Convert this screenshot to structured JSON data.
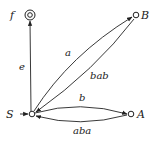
{
  "diagram": {
    "type": "finite-automaton",
    "nodes": [
      {
        "id": "S",
        "label": "S",
        "start": true,
        "accepting": false
      },
      {
        "id": "f",
        "label": "f",
        "start": false,
        "accepting": true
      },
      {
        "id": "B",
        "label": "B",
        "start": false,
        "accepting": false
      },
      {
        "id": "A",
        "label": "A",
        "start": false,
        "accepting": false
      }
    ],
    "edges": [
      {
        "from": "S",
        "to": "f",
        "label": "e"
      },
      {
        "from": "S",
        "to": "B",
        "label": "a"
      },
      {
        "from": "B",
        "to": "S",
        "label": "bab"
      },
      {
        "from": "S",
        "to": "A",
        "label": "b"
      },
      {
        "from": "A",
        "to": "S",
        "label": "aba"
      }
    ]
  },
  "labels": {
    "S": "S",
    "f": "f",
    "B": "B",
    "A": "A",
    "e": "e",
    "a": "a",
    "bab": "bab",
    "b": "b",
    "aba": "aba"
  },
  "colors": {
    "stroke": "#222222",
    "background": "#ffffff"
  }
}
